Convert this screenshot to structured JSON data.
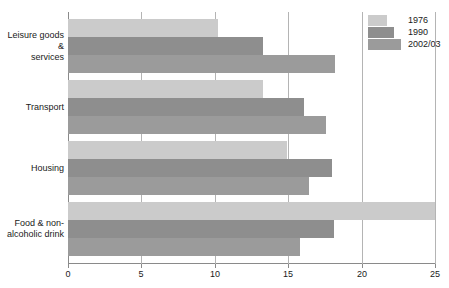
{
  "chart_data": {
    "type": "bar",
    "orientation": "horizontal",
    "title": "",
    "subtitle": "",
    "xlabel": "",
    "ylabel": "",
    "xlim": [
      0,
      25
    ],
    "xticks": [
      "0",
      "5",
      "10",
      "15",
      "20",
      "25"
    ],
    "xtick_values": [
      0,
      5,
      10,
      15,
      20,
      25
    ],
    "grid": "vertical",
    "legend_position": "top-right",
    "categories": [
      "Leisure goods & services",
      "Transport",
      "Housing",
      "Food & non-alcoholic drink"
    ],
    "category_lines": [
      [
        "Leisure goods &",
        "services"
      ],
      [
        "Transport"
      ],
      [
        "Housing"
      ],
      [
        "Food & non-",
        "alcoholic drink"
      ]
    ],
    "series": [
      {
        "name": "1976",
        "color": "#cbcbcb",
        "values": [
          10.2,
          13.3,
          14.9,
          25.0
        ]
      },
      {
        "name": "1990",
        "color": "#8e8e8e",
        "values": [
          13.3,
          16.1,
          18.0,
          18.1
        ]
      },
      {
        "name": "2002/03",
        "color": "#9b9b9b",
        "values": [
          18.2,
          17.6,
          16.4,
          15.8
        ]
      }
    ]
  },
  "legend": {
    "entries": [
      {
        "label": "1976"
      },
      {
        "label": "1990"
      },
      {
        "label": "2002/03"
      }
    ]
  },
  "axis": {
    "x_ticks": [
      {
        "label": "0",
        "value": 0
      },
      {
        "label": "5",
        "value": 5
      },
      {
        "label": "10",
        "value": 10
      },
      {
        "label": "15",
        "value": 15
      },
      {
        "label": "20",
        "value": 20
      },
      {
        "label": "25",
        "value": 25
      }
    ]
  }
}
